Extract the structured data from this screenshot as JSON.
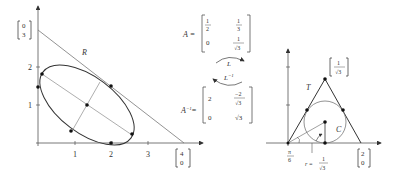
{
  "left_figure": {
    "x_ticks": [
      "1",
      "2",
      "3"
    ],
    "y_ticks": [
      "1",
      "2"
    ],
    "region_label": "R",
    "y_intercept_vector": {
      "top": "0",
      "bottom": "3"
    },
    "x_intercept_vector": {
      "top": "4",
      "bottom": "0"
    }
  },
  "matrices": {
    "A": {
      "name": "A =",
      "r1c1_num": "1",
      "r1c1_den": "2",
      "r1c2_num": "1",
      "r1c2_den": "3",
      "r2c1": "0",
      "r2c2_num": "1",
      "r2c2_den": "√3"
    },
    "A_inv": {
      "name": "A",
      "sup": "−1",
      "eq": "=",
      "r1c1": "2",
      "r1c2_num": "−2",
      "r1c2_den": "√3",
      "r2c1": "0",
      "r2c2": "√3"
    },
    "arrow_L": "L",
    "arrow_L_inv": "L",
    "arrow_L_inv_sup": "−1"
  },
  "right_figure": {
    "triangle_label": "T",
    "circle_label": "C",
    "apex_vector": {
      "top": "1",
      "bottom": "√3"
    },
    "x_vector": {
      "top": "2",
      "bottom": "0"
    },
    "angle_num": "π",
    "angle_den": "6",
    "radius_label": "r =",
    "radius_num": "1",
    "radius_den": "√3"
  }
}
